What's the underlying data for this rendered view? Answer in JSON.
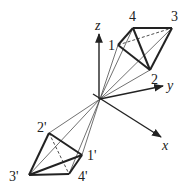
{
  "diagram": {
    "origin": [
      100,
      99
    ],
    "axes": [
      {
        "name": "z",
        "label": "z",
        "end": [
          99,
          33
        ],
        "label_pos": [
          95,
          28
        ]
      },
      {
        "name": "y",
        "label": "y",
        "end": [
          163,
          86
        ],
        "label_pos": [
          167,
          90
        ]
      },
      {
        "name": "x",
        "label": "x",
        "end": [
          161,
          137
        ],
        "label_pos": [
          162,
          150
        ]
      }
    ],
    "upper_tetrahedron": {
      "vertices": [
        {
          "id": "1",
          "label": "1",
          "pos": [
            118,
            45
          ],
          "label_pos": [
            108,
            48
          ]
        },
        {
          "id": "2",
          "label": "2",
          "pos": [
            150,
            70
          ],
          "label_pos": [
            151,
            84
          ]
        },
        {
          "id": "3",
          "label": "3",
          "pos": [
            172,
            28
          ],
          "label_pos": [
            172,
            20
          ]
        },
        {
          "id": "4",
          "label": "4",
          "pos": [
            133,
            28
          ],
          "label_pos": [
            129,
            20
          ]
        }
      ]
    },
    "lower_tetrahedron": {
      "vertices": [
        {
          "id": "1p",
          "label": "1'",
          "pos": [
            82,
            155
          ],
          "label_pos": [
            88,
            158
          ]
        },
        {
          "id": "2p",
          "label": "2'",
          "pos": [
            49,
            133
          ],
          "label_pos": [
            37,
            131
          ]
        },
        {
          "id": "3p",
          "label": "3'",
          "pos": [
            29,
            175
          ],
          "label_pos": [
            10,
            180
          ]
        },
        {
          "id": "4p",
          "label": "4'",
          "pos": [
            69,
            174
          ],
          "label_pos": [
            79,
            180
          ]
        }
      ]
    },
    "colors": {
      "stroke": "#222222",
      "background": "#ffffff"
    }
  }
}
